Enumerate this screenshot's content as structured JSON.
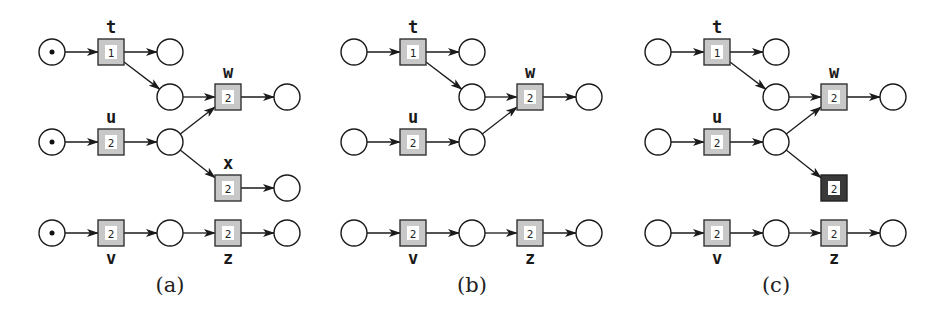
{
  "diagram": {
    "type": "petri-net-figure",
    "colors": {
      "transition_fill": "#c8c8c8",
      "transition_disabled_fill": "#3a3a3a",
      "place_stroke": "#1a1a1a",
      "background": "#ffffff"
    },
    "panels": [
      {
        "caption": "(a)",
        "offset_x": 0,
        "tokens": [
          "p_t_in",
          "p_u_in",
          "p_v_in"
        ],
        "transitions": [
          {
            "id": "t",
            "label": "t",
            "weight": "1",
            "row": 0,
            "col": 1,
            "label_pos": "above"
          },
          {
            "id": "w",
            "label": "w",
            "weight": "2",
            "row": 1,
            "col": 3,
            "label_pos": "above"
          },
          {
            "id": "u",
            "label": "u",
            "weight": "2",
            "row": 2,
            "col": 1,
            "label_pos": "above"
          },
          {
            "id": "x",
            "label": "x",
            "weight": "2",
            "row": 3,
            "col": 3,
            "label_pos": "above"
          },
          {
            "id": "v",
            "label": "v",
            "weight": "2",
            "row": 4,
            "col": 1,
            "label_pos": "below"
          },
          {
            "id": "z",
            "label": "z",
            "weight": "2",
            "row": 4,
            "col": 3,
            "label_pos": "below"
          }
        ],
        "places": [
          {
            "id": "p_t_in",
            "row": 0,
            "col": 0
          },
          {
            "id": "p_t_out",
            "row": 0,
            "col": 2
          },
          {
            "id": "p_tw",
            "row": 1,
            "col": 2
          },
          {
            "id": "p_w_out",
            "row": 1,
            "col": 4
          },
          {
            "id": "p_u_in",
            "row": 2,
            "col": 0
          },
          {
            "id": "p_u_out",
            "row": 2,
            "col": 2
          },
          {
            "id": "p_x_out",
            "row": 3,
            "col": 4
          },
          {
            "id": "p_v_in",
            "row": 4,
            "col": 0
          },
          {
            "id": "p_vz",
            "row": 4,
            "col": 2
          },
          {
            "id": "p_z_out",
            "row": 4,
            "col": 4
          }
        ],
        "arcs": [
          [
            "p_t_in",
            "t"
          ],
          [
            "t",
            "p_t_out"
          ],
          [
            "t",
            "p_tw"
          ],
          [
            "p_tw",
            "w"
          ],
          [
            "w",
            "p_w_out"
          ],
          [
            "p_u_in",
            "u"
          ],
          [
            "u",
            "p_u_out"
          ],
          [
            "p_u_out",
            "w"
          ],
          [
            "p_u_out",
            "x"
          ],
          [
            "x",
            "p_x_out"
          ],
          [
            "p_v_in",
            "v"
          ],
          [
            "v",
            "p_vz"
          ],
          [
            "p_vz",
            "z"
          ],
          [
            "z",
            "p_z_out"
          ]
        ]
      },
      {
        "caption": "(b)",
        "offset_x": 302,
        "tokens": [],
        "transitions": [
          {
            "id": "t",
            "label": "t",
            "weight": "1",
            "row": 0,
            "col": 1,
            "label_pos": "above"
          },
          {
            "id": "w",
            "label": "w",
            "weight": "2",
            "row": 1,
            "col": 3,
            "label_pos": "above"
          },
          {
            "id": "u",
            "label": "u",
            "weight": "2",
            "row": 2,
            "col": 1,
            "label_pos": "above"
          },
          {
            "id": "v",
            "label": "v",
            "weight": "2",
            "row": 4,
            "col": 1,
            "label_pos": "below"
          },
          {
            "id": "z",
            "label": "z",
            "weight": "2",
            "row": 4,
            "col": 3,
            "label_pos": "below"
          }
        ],
        "places": [
          {
            "id": "p_t_in",
            "row": 0,
            "col": 0
          },
          {
            "id": "p_t_out",
            "row": 0,
            "col": 2
          },
          {
            "id": "p_tw",
            "row": 1,
            "col": 2
          },
          {
            "id": "p_w_out",
            "row": 1,
            "col": 4
          },
          {
            "id": "p_u_in",
            "row": 2,
            "col": 0
          },
          {
            "id": "p_u_out",
            "row": 2,
            "col": 2
          },
          {
            "id": "p_v_in",
            "row": 4,
            "col": 0
          },
          {
            "id": "p_vz",
            "row": 4,
            "col": 2
          },
          {
            "id": "p_z_out",
            "row": 4,
            "col": 4
          }
        ],
        "arcs": [
          [
            "p_t_in",
            "t"
          ],
          [
            "t",
            "p_t_out"
          ],
          [
            "t",
            "p_tw"
          ],
          [
            "p_tw",
            "w"
          ],
          [
            "w",
            "p_w_out"
          ],
          [
            "p_u_in",
            "u"
          ],
          [
            "u",
            "p_u_out"
          ],
          [
            "p_u_out",
            "w"
          ],
          [
            "p_v_in",
            "v"
          ],
          [
            "v",
            "p_vz"
          ],
          [
            "p_vz",
            "z"
          ],
          [
            "z",
            "p_z_out"
          ]
        ]
      },
      {
        "caption": "(c)",
        "offset_x": 606,
        "tokens": [],
        "transitions": [
          {
            "id": "t",
            "label": "t",
            "weight": "1",
            "row": 0,
            "col": 1,
            "label_pos": "above"
          },
          {
            "id": "w",
            "label": "w",
            "weight": "2",
            "row": 1,
            "col": 3,
            "label_pos": "above"
          },
          {
            "id": "u",
            "label": "u",
            "weight": "2",
            "row": 2,
            "col": 1,
            "label_pos": "above"
          },
          {
            "id": "x",
            "label": "",
            "weight": "2",
            "row": 3,
            "col": 3,
            "label_pos": "none",
            "dark": true
          },
          {
            "id": "v",
            "label": "v",
            "weight": "2",
            "row": 4,
            "col": 1,
            "label_pos": "below"
          },
          {
            "id": "z",
            "label": "z",
            "weight": "2",
            "row": 4,
            "col": 3,
            "label_pos": "below"
          }
        ],
        "places": [
          {
            "id": "p_t_in",
            "row": 0,
            "col": 0
          },
          {
            "id": "p_t_out",
            "row": 0,
            "col": 2
          },
          {
            "id": "p_tw",
            "row": 1,
            "col": 2
          },
          {
            "id": "p_w_out",
            "row": 1,
            "col": 4
          },
          {
            "id": "p_u_in",
            "row": 2,
            "col": 0
          },
          {
            "id": "p_u_out",
            "row": 2,
            "col": 2
          },
          {
            "id": "p_v_in",
            "row": 4,
            "col": 0
          },
          {
            "id": "p_vz",
            "row": 4,
            "col": 2
          },
          {
            "id": "p_z_out",
            "row": 4,
            "col": 4
          }
        ],
        "arcs": [
          [
            "p_t_in",
            "t"
          ],
          [
            "t",
            "p_t_out"
          ],
          [
            "t",
            "p_tw"
          ],
          [
            "p_tw",
            "w"
          ],
          [
            "w",
            "p_w_out"
          ],
          [
            "p_u_in",
            "u"
          ],
          [
            "u",
            "p_u_out"
          ],
          [
            "p_u_out",
            "w"
          ],
          [
            "p_u_out",
            "x"
          ],
          [
            "p_v_in",
            "v"
          ],
          [
            "v",
            "p_vz"
          ],
          [
            "p_vz",
            "z"
          ],
          [
            "z",
            "p_z_out"
          ]
        ]
      }
    ]
  }
}
